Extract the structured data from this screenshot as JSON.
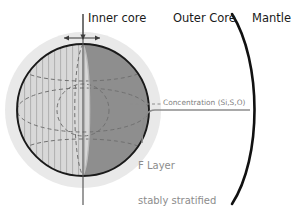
{
  "figure": {
    "labels": {
      "inner_core": "Inner core",
      "outer_core": "Outer Core",
      "mantle": "Mantle",
      "concentration": "Concentration (Si,S,O)",
      "f_layer_line1": "F Layer",
      "f_layer_line2": "stably stratified"
    },
    "colors": {
      "halo": "#e6e6e6",
      "left_hemisphere": "#d5d5d5",
      "right_hemisphere": "#8c8c8c",
      "sphere_outline": "#1a1a1a",
      "hatch_line": "#a8a8a8",
      "dashed_line": "#6e6e6e",
      "mantle_arc": "#111111",
      "concentration_line": "#8c8c8c",
      "axis_line": "#555555",
      "label_dark": "#1a1a1a",
      "label_gray": "#8c8c8c",
      "background": "#ffffff"
    },
    "geometry": {
      "sphere_center_x": 83,
      "sphere_center_y": 110,
      "sphere_radius": 66,
      "halo_radius": 78,
      "mantle_arc_top_x": 232,
      "mantle_arc_top_y": 14,
      "mantle_arc_bottom_x": 232,
      "mantle_arc_bottom_y": 204,
      "concentration_line_y": 110
    }
  }
}
